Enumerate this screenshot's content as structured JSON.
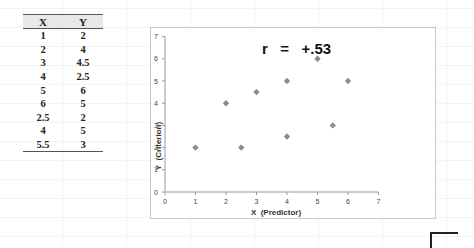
{
  "table": {
    "headers": [
      "X",
      "Y"
    ],
    "rows": [
      [
        "1",
        "2"
      ],
      [
        "2",
        "4"
      ],
      [
        "3",
        "4.5"
      ],
      [
        "4",
        "2.5"
      ],
      [
        "5",
        "6"
      ],
      [
        "6",
        "5"
      ],
      [
        "2.5",
        "2"
      ],
      [
        "4",
        "5"
      ],
      [
        "5.5",
        "3"
      ]
    ]
  },
  "chart_data": {
    "type": "scatter",
    "title": "",
    "annotation": "r   =   +.53",
    "xlabel": "X  (Predictor)",
    "ylabel": "Y  (Criterion)",
    "xlim": [
      0,
      7
    ],
    "ylim": [
      0,
      7
    ],
    "x_ticks": [
      "0",
      "1",
      "2",
      "3",
      "4",
      "5",
      "6",
      "7"
    ],
    "y_ticks": [
      "0",
      "1",
      "2",
      "3",
      "4",
      "5",
      "6",
      "7"
    ],
    "grid": false,
    "legend": null,
    "marker_color": "#8c8c8c",
    "points": [
      {
        "x": 1,
        "y": 2
      },
      {
        "x": 2,
        "y": 4
      },
      {
        "x": 3,
        "y": 4.5
      },
      {
        "x": 4,
        "y": 2.5
      },
      {
        "x": 5,
        "y": 6
      },
      {
        "x": 6,
        "y": 5
      },
      {
        "x": 2.5,
        "y": 2
      },
      {
        "x": 4,
        "y": 5
      },
      {
        "x": 5.5,
        "y": 3
      }
    ]
  }
}
